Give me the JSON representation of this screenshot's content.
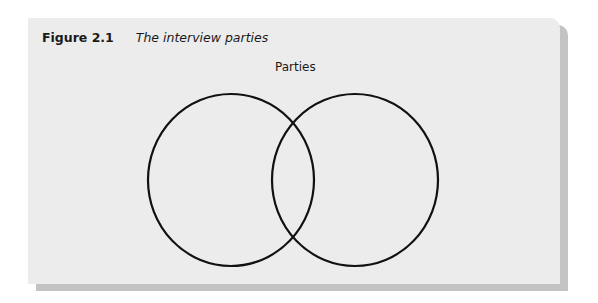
{
  "figure": {
    "number": "Figure 2.1",
    "title": "The interview parties"
  },
  "diagram": {
    "type": "venn",
    "label": "Parties",
    "circles": [
      {
        "cx": 231,
        "cy": 180,
        "rx": 83,
        "ry": 86
      },
      {
        "cx": 355,
        "cy": 180,
        "rx": 83,
        "ry": 86
      }
    ],
    "stroke_color": "#111111",
    "background_color": "#ececec",
    "shadow_color": "#c3c3c3"
  }
}
